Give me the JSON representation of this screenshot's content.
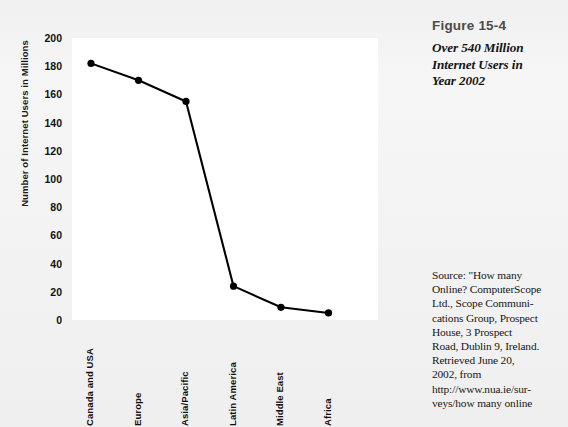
{
  "figure": {
    "number": "Figure 15-4",
    "title_lines": [
      "Over 540 Million",
      "Internet Users in",
      "Year 2002"
    ],
    "title_full": "Over 540 Million Internet Users in Year 2002",
    "source_lines": [
      "Source: \"How many",
      "Online? ComputerScope",
      "Ltd., Scope Communi-",
      "cations Group, Prospect",
      "House, 3 Prospect",
      "Road, Dublin 9, Ireland.",
      "Retrieved June 20,",
      "2002, from",
      "http://www.nua.ie/sur-",
      "veys/how many online"
    ]
  },
  "chart_data": {
    "type": "line",
    "xlabel": "",
    "ylabel": "Number of Internet Users in Millions",
    "categories": [
      "Canada and USA",
      "Europe",
      "Asia/Pacific",
      "Latin America",
      "Middle East",
      "Africa"
    ],
    "values": [
      182,
      170,
      155,
      24,
      9,
      5
    ],
    "ylim": [
      0,
      200
    ],
    "yticks": [
      0,
      20,
      40,
      60,
      80,
      100,
      120,
      140,
      160,
      180,
      200
    ],
    "ytick_labels": [
      "0",
      "20",
      "40",
      "60",
      "80",
      "100",
      "120",
      "140",
      "160",
      "180",
      "200"
    ],
    "grid": false,
    "legend": "none",
    "marker": "filled-circle",
    "line_color": "#000000",
    "marker_color": "#000000",
    "plot_background": "#ffffff",
    "page_background": "#f2f2f2"
  }
}
